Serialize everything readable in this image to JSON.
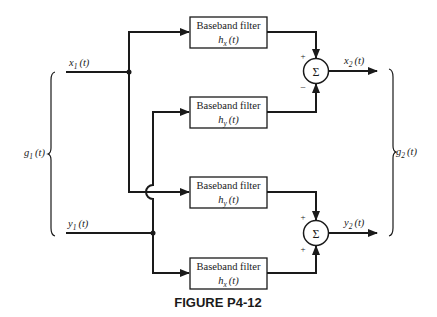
{
  "figure": {
    "caption": "FIGURE P4-12",
    "colors": {
      "ink": "#1a1a1a",
      "background": "#ffffff"
    }
  },
  "inputs": {
    "group_label": "g",
    "group_sub": "1",
    "x1": {
      "sym": "x",
      "sub": "1",
      "arg": "(t)"
    },
    "y1": {
      "sym": "y",
      "sub": "1",
      "arg": "(t)"
    }
  },
  "outputs": {
    "group_label": "g",
    "group_sub": "2",
    "x2": {
      "sym": "x",
      "sub": "2",
      "arg": "(t)"
    },
    "y2": {
      "sym": "y",
      "sub": "2",
      "arg": "(t)"
    }
  },
  "filters": [
    {
      "title": "Baseband filter",
      "sym": "h",
      "sub": "x",
      "arg": "(t)"
    },
    {
      "title": "Baseband filter",
      "sym": "h",
      "sub": "y",
      "arg": "(t)"
    },
    {
      "title": "Baseband filter",
      "sym": "h",
      "sub": "y",
      "arg": "(t)"
    },
    {
      "title": "Baseband filter",
      "sym": "h",
      "sub": "x",
      "arg": "(t)"
    }
  ],
  "summers": [
    {
      "symbol": "Σ",
      "top_sign": "+",
      "bottom_sign": "−"
    },
    {
      "symbol": "Σ",
      "top_sign": "+",
      "bottom_sign": "+"
    }
  ]
}
